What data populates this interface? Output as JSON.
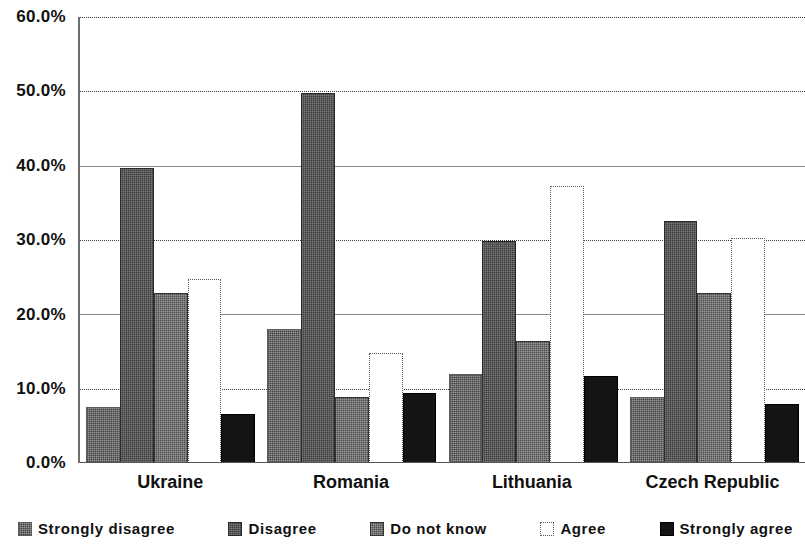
{
  "chart_data": {
    "type": "bar",
    "title": "",
    "subtitle": "",
    "xlabel": "",
    "ylabel": "",
    "categories": [
      "Ukraine",
      "Romania",
      "Lithuania",
      "Czech Republic"
    ],
    "series": [
      {
        "name": "Strongly disagree",
        "values": [
          7.3,
          17.7,
          11.7,
          8.6
        ],
        "color": "#9a9a9a"
      },
      {
        "name": "Disagree",
        "values": [
          39.4,
          49.5,
          29.6,
          32.3
        ],
        "color": "#3d3d3d"
      },
      {
        "name": "Do not know",
        "values": [
          22.6,
          8.6,
          16.2,
          22.6
        ],
        "color": "#4f4f4f"
      },
      {
        "name": "Agree",
        "values": [
          24.5,
          14.6,
          37.0,
          30.0
        ],
        "color": "#ffffff"
      },
      {
        "name": "Strongly agree",
        "values": [
          6.3,
          9.2,
          11.4,
          7.7
        ],
        "color": "#141414"
      }
    ],
    "ylim": [
      0,
      60
    ],
    "ytick_values": [
      0,
      10,
      20,
      30,
      40,
      50,
      60
    ],
    "ytick_labels": [
      "0.0%",
      "10.0%",
      "20.0%",
      "30.0%",
      "40.0%",
      "50.0%",
      "60.0%"
    ],
    "grid": true,
    "grid_style": "dotted-horizontal",
    "legend_position": "bottom",
    "value_format": "percent"
  },
  "legend": {
    "items": [
      {
        "label": "Strongly disagree"
      },
      {
        "label": "Disagree"
      },
      {
        "label": "Do not know"
      },
      {
        "label": "Agree"
      },
      {
        "label": "Strongly agree"
      }
    ]
  },
  "axis": {
    "y_labels": [
      "60.0%",
      "50.0%",
      "40.0%",
      "30.0%",
      "20.0%",
      "10.0%",
      "0.0%"
    ],
    "x_labels": [
      "Ukraine",
      "Romania",
      "Lithuania",
      "Czech Republic"
    ]
  }
}
